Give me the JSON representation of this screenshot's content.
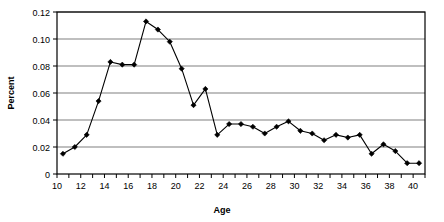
{
  "chart_data": {
    "type": "line",
    "title": "",
    "xlabel": "Age",
    "ylabel": "Percent",
    "xlim": [
      10,
      41
    ],
    "ylim": [
      0,
      0.12
    ],
    "grid": true,
    "legend": false,
    "marker": "diamond",
    "line_color": "#000000",
    "marker_color": "#000000",
    "grid_color": "#808080",
    "axis_color": "#000000",
    "plot_border": true,
    "x_tick_labels": [
      "10",
      "12",
      "14",
      "16",
      "18",
      "20",
      "22",
      "24",
      "26",
      "28",
      "30",
      "32",
      "34",
      "36",
      "38",
      "40"
    ],
    "x_tick_values": [
      10,
      12,
      14,
      16,
      18,
      20,
      22,
      24,
      26,
      28,
      30,
      32,
      34,
      36,
      38,
      40
    ],
    "x_minor_tick_values": [
      11,
      13,
      15,
      17,
      19,
      21,
      23,
      25,
      27,
      29,
      31,
      33,
      35,
      37,
      39,
      41
    ],
    "y_tick_labels": [
      "0",
      "0.02",
      "0.04",
      "0.06",
      "0.08",
      "0.10",
      "0.12"
    ],
    "y_tick_values": [
      0,
      0.02,
      0.04,
      0.06,
      0.08,
      0.1,
      0.12
    ],
    "x": [
      10.5,
      11.5,
      12.5,
      13.5,
      14.5,
      15.5,
      16.5,
      17.5,
      18.5,
      19.5,
      20.5,
      21.5,
      22.5,
      23.5,
      24.5,
      25.5,
      26.5,
      27.5,
      28.5,
      29.5,
      30.5,
      31.5,
      32.5,
      33.5,
      34.5,
      35.5,
      36.5,
      37.5,
      38.5,
      39.5,
      40.5
    ],
    "values": [
      0.015,
      0.02,
      0.029,
      0.054,
      0.083,
      0.081,
      0.081,
      0.113,
      0.107,
      0.098,
      0.078,
      0.051,
      0.063,
      0.029,
      0.037,
      0.037,
      0.035,
      0.03,
      0.035,
      0.039,
      0.032,
      0.03,
      0.025,
      0.029,
      0.027,
      0.029,
      0.015,
      0.022,
      0.017,
      0.008,
      0.008
    ]
  }
}
